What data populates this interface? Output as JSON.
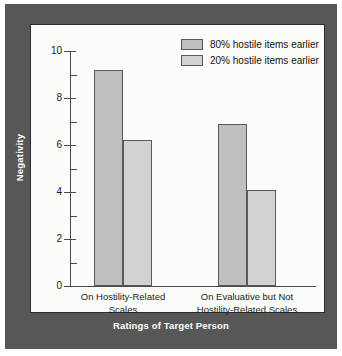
{
  "chart_data": {
    "type": "bar",
    "title": "",
    "xlabel": "Ratings of Target Person",
    "ylabel": "Negativity",
    "ylim": [
      0,
      10
    ],
    "ytick_labels": [
      "0",
      "2",
      "4",
      "6",
      "8",
      "10"
    ],
    "ytick_values": [
      0,
      2,
      4,
      6,
      8,
      10
    ],
    "minor_ticks": [
      1,
      3,
      5,
      7,
      9
    ],
    "grid": false,
    "legend_position": "top-right",
    "categories": [
      "On Hostility-Related Scales",
      "On Evaluative but Not Hostility-Related Scales"
    ],
    "category_lines": [
      [
        "On Hostility-Related",
        "Scales"
      ],
      [
        "On Evaluative but Not",
        "Hostility-Related Scales"
      ]
    ],
    "series": [
      {
        "name": "80% hostile items earlier",
        "color": "#bfbfbf",
        "values": [
          9.2,
          6.9
        ]
      },
      {
        "name": "20% hostile items earlier",
        "color": "#d2d2d2",
        "values": [
          6.2,
          4.1
        ]
      }
    ]
  },
  "legend": {
    "items": [
      {
        "label": "80% hostile items earlier"
      },
      {
        "label": "20% hostile items earlier"
      }
    ]
  },
  "axes": {
    "y_title": "Negativity",
    "x_title": "Ratings of Target Person",
    "y_labels": [
      "10",
      "8",
      "6",
      "4",
      "2",
      "0"
    ]
  },
  "colors": {
    "frame": "#575757",
    "panel": "#fbfbfa",
    "series_80": "#bfbfbf",
    "series_20": "#d2d2d2",
    "axis": "#4a4a4a",
    "text": "#1b1b1b",
    "frame_text": "#ffffff"
  }
}
